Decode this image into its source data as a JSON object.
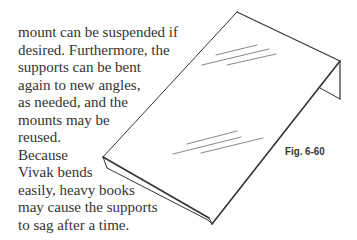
{
  "body_text": {
    "lines": [
      "mount can be suspended if",
      "desired. Furthermore, the",
      "supports can be bent",
      "again to new angles,",
      "as needed, and the",
      "mounts may be",
      "reused.",
      "Because",
      "Vivak bends",
      "easily, heavy books",
      "may cause the supports",
      "to sag after a time."
    ]
  },
  "figure": {
    "caption": "Fig. 6-60",
    "stroke_color": "#333333"
  }
}
